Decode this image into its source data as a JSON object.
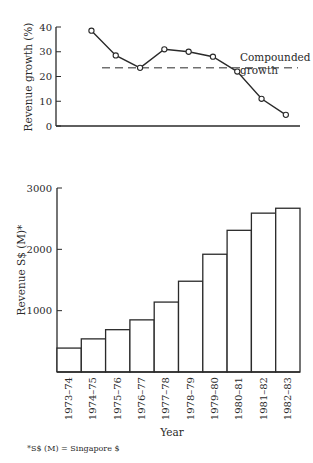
{
  "chart_data": [
    {
      "type": "line",
      "title": "",
      "xlabel": "",
      "ylabel": "Revenue growth (%)",
      "ylim": [
        0,
        40
      ],
      "yticks": [
        0,
        10,
        20,
        30,
        40
      ],
      "categories": [
        "1973-74",
        "1974-75",
        "1975-76",
        "1976-77",
        "1977-78",
        "1978-79",
        "1979-80",
        "1980-81",
        "1981-82",
        "1982-83"
      ],
      "series": [
        {
          "name": "Revenue growth",
          "x_categories": [
            "1974-75",
            "1975-76",
            "1976-77",
            "1977-78",
            "1978-79",
            "1979-80",
            "1980-81",
            "1981-82",
            "1982-83"
          ],
          "values": [
            38.5,
            28.5,
            23.5,
            31,
            30,
            28,
            22,
            11,
            4.5
          ]
        }
      ],
      "reference_line": {
        "label": "Compounded growth",
        "value": 23.5,
        "style": "dashed"
      },
      "annotations": [
        "Compounded",
        "growth"
      ],
      "grid": false
    },
    {
      "type": "bar",
      "title": "",
      "xlabel": "Year",
      "ylabel": "Revenue S$ (M)*",
      "ylim": [
        0,
        3000
      ],
      "yticks": [
        1000,
        2000,
        3000
      ],
      "categories": [
        "1973–74",
        "1974–75",
        "1975–76",
        "1976–77",
        "1977–78",
        "1978–79",
        "1979–80",
        "1980–81",
        "1981–82",
        "1982–83"
      ],
      "values": [
        390,
        540,
        690,
        850,
        1140,
        1480,
        1920,
        2310,
        2590,
        2670
      ],
      "grid": false,
      "footnote": "*S$ (M) = Singapore $"
    }
  ],
  "colors": {
    "ink": "#2a2a2a",
    "background": "#ffffff"
  }
}
